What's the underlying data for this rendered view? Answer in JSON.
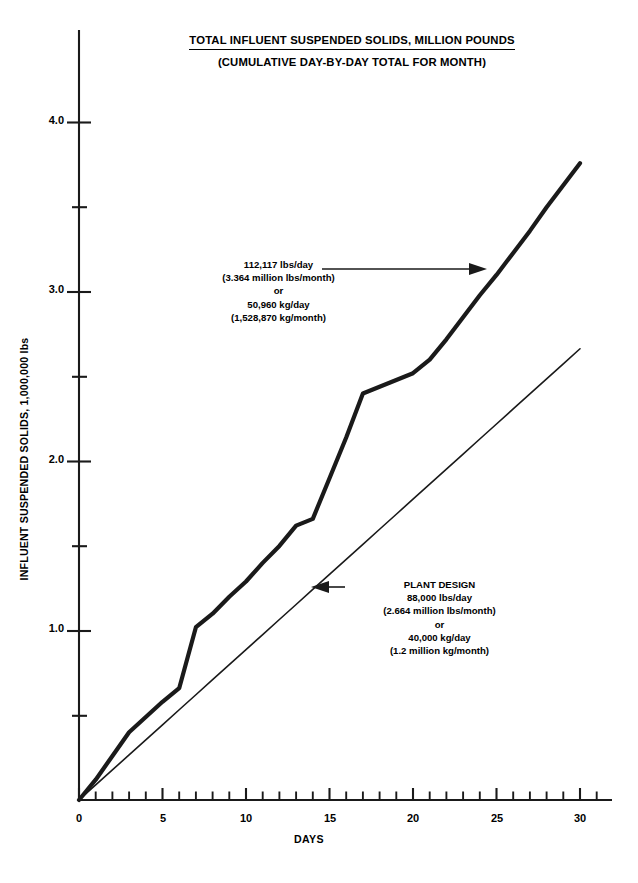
{
  "title": {
    "line1": "TOTAL INFLUENT SUSPENDED SOLIDS, MILLION POUNDS",
    "line2": "(CUMULATIVE DAY-BY-DAY TOTAL FOR MONTH)"
  },
  "axes": {
    "ylabel": "INFLUENT SUSPENDED SOLIDS, 1,000,000 lbs",
    "xlabel": "DAYS",
    "yticks": [
      "1.0",
      "2.0",
      "3.0",
      "4.0"
    ],
    "xticks": [
      "0",
      "5",
      "10",
      "15",
      "20",
      "25",
      "30"
    ]
  },
  "annotations": {
    "actual": {
      "l1": "112,117 lbs/day",
      "l2": "(3.364 million lbs/month)",
      "l3": "or",
      "l4": "50,960 kg/day",
      "l5": "(1,528,870 kg/month)"
    },
    "design": {
      "l1": "PLANT DESIGN",
      "l2": "88,000 lbs/day",
      "l3": "(2.664 million lbs/month)",
      "l4": "or",
      "l5": "40,000 kg/day",
      "l6": "(1.2 million kg/month)"
    }
  },
  "chart_data": {
    "type": "line",
    "title": "TOTAL INFLUENT SUSPENDED SOLIDS, MILLION POUNDS (CUMULATIVE DAY-BY-DAY TOTAL FOR MONTH)",
    "xlabel": "DAYS",
    "ylabel": "INFLUENT SUSPENDED SOLIDS, 1,000,000 lbs",
    "xlim": [
      0,
      31.5
    ],
    "ylim": [
      0,
      4.45
    ],
    "xticks": [
      0,
      5,
      10,
      15,
      20,
      25,
      30
    ],
    "xminor_step": 1,
    "yticks": [
      1.0,
      2.0,
      3.0,
      4.0
    ],
    "yminor": [
      0.5,
      1.5,
      2.5,
      3.5
    ],
    "grid": false,
    "legend": "none",
    "x": [
      0,
      1,
      2,
      3,
      4,
      5,
      6,
      7,
      8,
      9,
      10,
      11,
      12,
      13,
      14,
      15,
      16,
      17,
      18,
      19,
      20,
      21,
      22,
      23,
      24,
      25,
      26,
      27,
      28,
      29,
      30
    ],
    "series": [
      {
        "name": "Actual cumulative influent suspended solids",
        "style": "thick",
        "rate_lbs_per_day": 112117,
        "month_total_million_lbs": 3.364,
        "values": [
          0,
          0.12,
          0.26,
          0.4,
          0.49,
          0.58,
          0.66,
          1.02,
          1.1,
          1.2,
          1.29,
          1.4,
          1.5,
          1.62,
          1.66,
          1.9,
          2.14,
          2.4,
          2.44,
          2.48,
          2.52,
          2.6,
          2.72,
          2.85,
          2.98,
          3.1,
          3.23,
          3.36,
          3.5,
          3.63,
          3.76
        ]
      },
      {
        "name": "PLANT DESIGN",
        "style": "thin",
        "rate_lbs_per_day": 88000,
        "month_total_million_lbs": 2.664,
        "values": [
          0,
          0.0888,
          0.1776,
          0.2664,
          0.3552,
          0.444,
          0.5328,
          0.6216,
          0.7104,
          0.7992,
          0.888,
          0.9768,
          1.0656,
          1.1544,
          1.2432,
          1.332,
          1.4208,
          1.5096,
          1.5984,
          1.6872,
          1.776,
          1.8648,
          1.9536,
          2.0424,
          2.1312,
          2.22,
          2.3088,
          2.3976,
          2.4864,
          2.5752,
          2.664
        ]
      }
    ],
    "annotations": [
      {
        "text": "112,117 lbs/day (3.364 million lbs/month) or 50,960 kg/day (1,528,870 kg/month)",
        "points_to_series": "Actual cumulative influent suspended solids",
        "arrow_target_x": 24.1,
        "arrow_target_y": 3.02
      },
      {
        "text": "PLANT DESIGN 88,000 lbs/day (2.664 million lbs/month) or 40,000 kg/day (1.2 million kg/month)",
        "points_to_series": "PLANT DESIGN",
        "arrow_target_x": 14.5,
        "arrow_target_y": 1.3
      }
    ]
  }
}
